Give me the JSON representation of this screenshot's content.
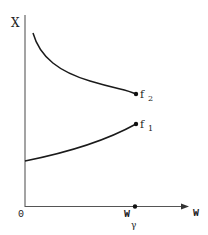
{
  "figure": {
    "type": "diagram",
    "y_axis": {
      "label": "X"
    },
    "x_axis": {
      "label": "W",
      "origin_label": "0"
    },
    "marker": {
      "label_main": "W",
      "label_sub": "γ"
    },
    "curves": [
      {
        "id": "f2",
        "label_main": "f",
        "label_sub": "2",
        "trend": "decreasing",
        "color": "#1a1a1a"
      },
      {
        "id": "f1",
        "label_main": "f",
        "label_sub": "1",
        "trend": "increasing",
        "color": "#1a1a1a"
      }
    ],
    "colors": {
      "axis": "#555555",
      "curve": "#1a1a1a",
      "background": "#ffffff"
    }
  }
}
